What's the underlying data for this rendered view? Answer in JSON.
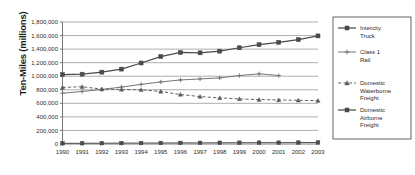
{
  "chart_data": {
    "type": "line",
    "title": "",
    "xlabel": "",
    "ylabel": "Ten-Miles (millions)",
    "grid": true,
    "legend_position": "right",
    "ylim": [
      0,
      1800000
    ],
    "ytick_step": 200000,
    "x": [
      "1990",
      "1991",
      "1992",
      "1993",
      "1994",
      "1995",
      "1996",
      "1997",
      "1998",
      "1999",
      "2000",
      "2001",
      "2002",
      "2003"
    ],
    "ytick_labels": [
      "0",
      "200,000",
      "400,000",
      "600,000",
      "800,000",
      "1,000,000",
      "1,200,000",
      "1,400,000",
      "1,600,000",
      "1,800,000"
    ],
    "series": [
      {
        "name": "Intercity Truck",
        "marker": "square",
        "dash": false,
        "color": "#4a4a4a",
        "values": [
          1025000,
          1030000,
          1060000,
          1105000,
          1195000,
          1290000,
          1350000,
          1345000,
          1370000,
          1420000,
          1465000,
          1500000,
          1540000,
          1595000
        ]
      },
      {
        "name": "Class 1 Rail",
        "marker": "plus",
        "dash": false,
        "color": "#6e6e6e",
        "values": [
          750000,
          775000,
          805000,
          840000,
          880000,
          915000,
          945000,
          960000,
          975000,
          1010000,
          1035000,
          1010000,
          null,
          null
        ]
      },
      {
        "name": "Domestic Waterborne Freight",
        "marker": "triangle",
        "dash": true,
        "color": "#5a5a5a",
        "values": [
          835000,
          845000,
          810000,
          805000,
          800000,
          775000,
          730000,
          700000,
          680000,
          665000,
          655000,
          650000,
          645000,
          640000
        ]
      },
      {
        "name": "Domestic Airborne Freight",
        "marker": "square",
        "dash": false,
        "color": "#4a4a4a",
        "values": [
          10000,
          11000,
          12000,
          13000,
          14000,
          15000,
          16000,
          17000,
          18000,
          19000,
          20000,
          20000,
          21000,
          22000
        ]
      }
    ]
  },
  "legend": {
    "entries": [
      {
        "label_line1": "Intercity",
        "label_line2": "Truck",
        "label_line3": ""
      },
      {
        "label_line1": "Class 1",
        "label_line2": "Rail",
        "label_line3": ""
      },
      {
        "label_line1": "Domestic",
        "label_line2": "Waterborne",
        "label_line3": "Freight"
      },
      {
        "label_line1": "Domestic",
        "label_line2": "Airborne",
        "label_line3": "Freight"
      }
    ]
  },
  "axis": {
    "y_title": "Ten-Miles (millions)"
  }
}
